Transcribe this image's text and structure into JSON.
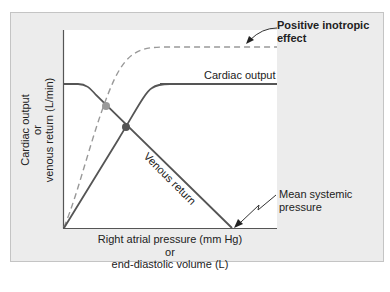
{
  "diagram": {
    "y_axis": {
      "line1": "Cardiac output",
      "line2": "or",
      "line3": "venous return (L/min)"
    },
    "x_axis": {
      "line1": "Right atrial pressure (mm Hg)",
      "line2": "or",
      "line3": "end-diastolic volume (L)"
    },
    "curves": {
      "cardiac_output": "Cardiac output",
      "venous_return": "Venous return",
      "positive_inotropic": {
        "line1": "Positive inotropic",
        "line2": "effect"
      }
    },
    "annotations": {
      "mean_systemic": {
        "line1": "Mean systemic",
        "line2": "pressure"
      }
    },
    "colors": {
      "curve": "#555555",
      "dashed_curve": "#999999",
      "equilibrium_dot": "#555555",
      "inotropic_dot": "#9a9a9a",
      "panel_bg": "#ececec",
      "plot_bg": "#ffffff"
    }
  }
}
